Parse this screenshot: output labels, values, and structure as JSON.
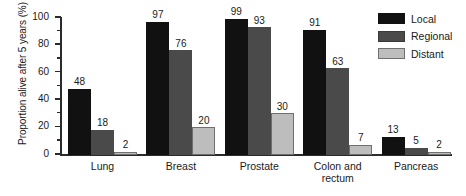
{
  "chart_data": {
    "type": "bar",
    "title": "",
    "xlabel": "",
    "ylabel": "Proportion alive after 5 years (%)",
    "ylim": [
      0,
      100
    ],
    "y_ticks_major": [
      0,
      20,
      40,
      60,
      80,
      100
    ],
    "y_ticks_minor": [
      10,
      30,
      50,
      70,
      90
    ],
    "grid": false,
    "legend_position": "top-right",
    "categories": [
      "Lung",
      "Breast",
      "Prostate",
      "Colon and\nrectum",
      "Pancreas"
    ],
    "series": [
      {
        "name": "Local",
        "color": "#111111",
        "values": [
          48,
          97,
          99,
          91,
          13
        ]
      },
      {
        "name": "Regional",
        "color": "#4a4a4a",
        "values": [
          18,
          76,
          93,
          63,
          5
        ]
      },
      {
        "name": "Distant",
        "color": "#bdbdbd",
        "values": [
          2,
          20,
          30,
          7,
          2
        ]
      }
    ]
  },
  "axis": {
    "y_tick_labels": [
      "100",
      "80",
      "60",
      "40",
      "20",
      "0"
    ],
    "y_title": "Proportion alive after 5 years (%)"
  },
  "legend": {
    "items": [
      {
        "label": "Local"
      },
      {
        "label": "Regional"
      },
      {
        "label": "Distant"
      }
    ]
  }
}
